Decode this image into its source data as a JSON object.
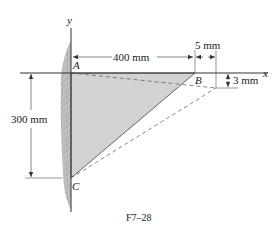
{
  "figure": {
    "caption": "F7–28",
    "axes": {
      "x_label": "x",
      "y_label": "y"
    },
    "points": {
      "A": {
        "label": "A",
        "px": [
          71,
          73
        ]
      },
      "B": {
        "label": "B",
        "px": [
          195,
          73
        ]
      },
      "C": {
        "label": "C",
        "px": [
          71,
          178
        ]
      },
      "B_displaced": {
        "px": [
          216,
          88
        ]
      }
    },
    "dimensions": {
      "horizontal_AB": "400 mm",
      "vertical_AC": "300 mm",
      "horizontal_disp_B": "5 mm",
      "vertical_disp_B": "3 mm"
    },
    "colors": {
      "plate_fill": "#d2d2d2",
      "wall_fill": "#9a9a9a",
      "line": "#333333",
      "dashed": "#555555"
    }
  }
}
